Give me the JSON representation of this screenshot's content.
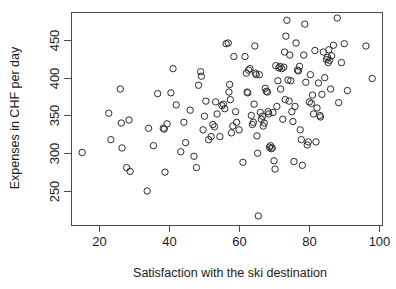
{
  "chart_data": {
    "type": "scatter",
    "title": "",
    "xlabel": "Satisfaction with the ski destination",
    "ylabel": "Expenses in CHF per day",
    "xlim": [
      12,
      101
    ],
    "ylim": [
      205,
      487
    ],
    "xticks": [
      20,
      40,
      60,
      80,
      100
    ],
    "yticks": [
      250,
      300,
      350,
      400,
      450
    ],
    "xtick_labels": [
      "20",
      "40",
      "60",
      "80",
      "100"
    ],
    "ytick_labels": [
      "250",
      "300",
      "350",
      "400",
      "450"
    ],
    "grid": false,
    "legend": null,
    "marker": "open-circle",
    "marker_color": "#2b2b2b",
    "n_points": 150,
    "points": [
      [
        15.2,
        301
      ],
      [
        22.8,
        353
      ],
      [
        23.4,
        318
      ],
      [
        26.1,
        385
      ],
      [
        26.4,
        340
      ],
      [
        26.6,
        307
      ],
      [
        27.9,
        281
      ],
      [
        28.6,
        344
      ],
      [
        28.9,
        276
      ],
      [
        33.8,
        250
      ],
      [
        34.2,
        333
      ],
      [
        35.6,
        310
      ],
      [
        36.8,
        379
      ],
      [
        38.4,
        333
      ],
      [
        38.7,
        332
      ],
      [
        38.9,
        275
      ],
      [
        39.5,
        339
      ],
      [
        40.6,
        380
      ],
      [
        41.2,
        412
      ],
      [
        42.1,
        364
      ],
      [
        43.4,
        302
      ],
      [
        44.3,
        341
      ],
      [
        44.8,
        314
      ],
      [
        46.1,
        357
      ],
      [
        47.2,
        296
      ],
      [
        47.9,
        281
      ],
      [
        48.5,
        390
      ],
      [
        49.1,
        408
      ],
      [
        49.3,
        402
      ],
      [
        49.8,
        331
      ],
      [
        50.2,
        349
      ],
      [
        50.6,
        369
      ],
      [
        51.4,
        318
      ],
      [
        52.1,
        322
      ],
      [
        52.6,
        338
      ],
      [
        53.1,
        335
      ],
      [
        53.4,
        368
      ],
      [
        53.8,
        352
      ],
      [
        54.6,
        322
      ],
      [
        55.2,
        363
      ],
      [
        55.6,
        365
      ],
      [
        56.0,
        359
      ],
      [
        56.4,
        445
      ],
      [
        57.0,
        446
      ],
      [
        57.2,
        381
      ],
      [
        57.4,
        391
      ],
      [
        57.6,
        371
      ],
      [
        57.9,
        327
      ],
      [
        58.3,
        336
      ],
      [
        58.6,
        428
      ],
      [
        59.1,
        355
      ],
      [
        59.4,
        341
      ],
      [
        60.1,
        331
      ],
      [
        61.2,
        288
      ],
      [
        61.8,
        428
      ],
      [
        62.2,
        406
      ],
      [
        62.4,
        381
      ],
      [
        62.6,
        380
      ],
      [
        62.8,
        410
      ],
      [
        63.2,
        412
      ],
      [
        63.6,
        350
      ],
      [
        63.9,
        338
      ],
      [
        64.2,
        341
      ],
      [
        64.4,
        365
      ],
      [
        64.6,
        442
      ],
      [
        64.8,
        406
      ],
      [
        65.0,
        404
      ],
      [
        65.2,
        323
      ],
      [
        65.4,
        300
      ],
      [
        65.6,
        217
      ],
      [
        65.9,
        404
      ],
      [
        66.2,
        354
      ],
      [
        66.5,
        345
      ],
      [
        66.8,
        349
      ],
      [
        67.0,
        336
      ],
      [
        67.3,
        340
      ],
      [
        67.6,
        386
      ],
      [
        67.9,
        382
      ],
      [
        68.2,
        381
      ],
      [
        68.4,
        355
      ],
      [
        68.6,
        352
      ],
      [
        68.8,
        308
      ],
      [
        69.1,
        310
      ],
      [
        69.3,
        306
      ],
      [
        69.6,
        307
      ],
      [
        69.8,
        354
      ],
      [
        70.1,
        290
      ],
      [
        70.4,
        279
      ],
      [
        70.6,
        416
      ],
      [
        70.9,
        362
      ],
      [
        71.2,
        396
      ],
      [
        71.5,
        413
      ],
      [
        71.8,
        415
      ],
      [
        72.0,
        385
      ],
      [
        72.3,
        412
      ],
      [
        72.6,
        345
      ],
      [
        72.9,
        414
      ],
      [
        73.1,
        434
      ],
      [
        73.3,
        371
      ],
      [
        73.5,
        455
      ],
      [
        73.8,
        476
      ],
      [
        74.1,
        397
      ],
      [
        74.4,
        369
      ],
      [
        74.6,
        430
      ],
      [
        74.9,
        396
      ],
      [
        75.2,
        355
      ],
      [
        75.5,
        342
      ],
      [
        75.8,
        289
      ],
      [
        76.1,
        362
      ],
      [
        76.4,
        446
      ],
      [
        76.8,
        410
      ],
      [
        77.1,
        409
      ],
      [
        77.4,
        415
      ],
      [
        77.6,
        331
      ],
      [
        77.9,
        318
      ],
      [
        78.2,
        284
      ],
      [
        78.6,
        430
      ],
      [
        78.9,
        471
      ],
      [
        79.2,
        394
      ],
      [
        79.6,
        311
      ],
      [
        79.9,
        315
      ],
      [
        80.2,
        368
      ],
      [
        80.5,
        404
      ],
      [
        80.8,
        366
      ],
      [
        81.1,
        377
      ],
      [
        81.4,
        352
      ],
      [
        81.8,
        436
      ],
      [
        82.1,
        315
      ],
      [
        82.4,
        360
      ],
      [
        82.8,
        393
      ],
      [
        83.2,
        350
      ],
      [
        83.4,
        348
      ],
      [
        83.8,
        378
      ],
      [
        84.2,
        434
      ],
      [
        84.6,
        400
      ],
      [
        85.1,
        424
      ],
      [
        85.4,
        427
      ],
      [
        85.6,
        420
      ],
      [
        85.8,
        437
      ],
      [
        86.0,
        423
      ],
      [
        86.3,
        385
      ],
      [
        86.6,
        429
      ],
      [
        87.1,
        443
      ],
      [
        88.2,
        479
      ],
      [
        88.6,
        367
      ],
      [
        89.4,
        420
      ],
      [
        90.2,
        445
      ],
      [
        91.1,
        383
      ],
      [
        96.4,
        442
      ],
      [
        98.2,
        399
      ]
    ]
  },
  "plot_geometry": {
    "frame_left": 71,
    "frame_right": 382,
    "frame_top": 12,
    "frame_bottom": 225,
    "marker_radius": 3.2
  }
}
